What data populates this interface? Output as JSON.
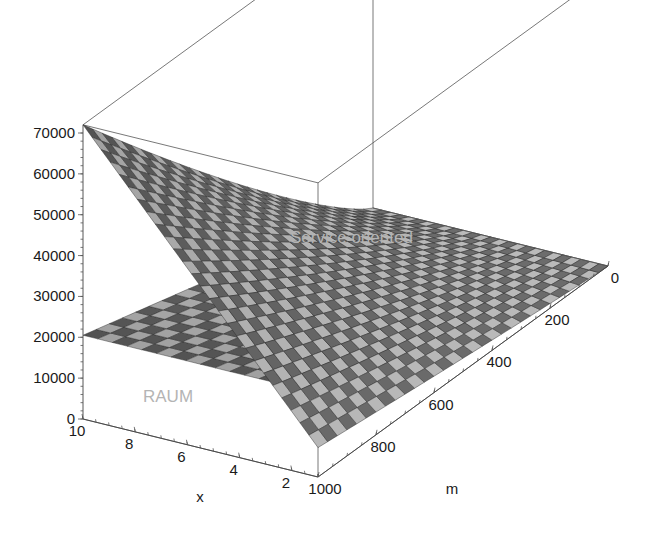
{
  "figure": {
    "kind": "3d-surface-mesh-plot",
    "background_color": "#ffffff",
    "line_color": "#555555",
    "label_color": "#b4b4b4",
    "tick_text_color": "#1a1a1a"
  },
  "axes": {
    "z": {
      "name": "z-axis",
      "title": "",
      "ticks": [
        0,
        10000,
        20000,
        30000,
        40000,
        50000,
        60000,
        70000
      ],
      "tick_labels": [
        "0",
        "10000",
        "20000",
        "30000",
        "40000",
        "50000",
        "60000",
        "70000"
      ],
      "range": [
        0,
        72000
      ]
    },
    "x": {
      "name": "x-axis",
      "title": "x",
      "ticks": [
        10,
        8,
        6,
        4,
        2
      ],
      "tick_labels": [
        "10",
        "8",
        "6",
        "4",
        "2"
      ],
      "range": [
        10,
        1
      ]
    },
    "m": {
      "name": "m-axis",
      "title": "m",
      "ticks": [
        1000,
        800,
        600,
        400,
        200,
        0
      ],
      "tick_labels": [
        "1000",
        "800",
        "600",
        "400",
        "200",
        "0"
      ],
      "range": [
        1000,
        0
      ]
    }
  },
  "annotations": [
    {
      "id": "service-oriented",
      "text": "Service oriented",
      "x": 290,
      "y": 243,
      "font_size": 17,
      "color": "#b4b4b4"
    },
    {
      "id": "raum",
      "text": "RAUM",
      "x": 143,
      "y": 402,
      "font_size": 17,
      "color": "#b4b4b4"
    }
  ],
  "chart_data": {
    "type": "surface",
    "title": "",
    "xlabel": "x",
    "ylabel": "m",
    "zlabel": "",
    "xlim": [
      1,
      10
    ],
    "ylim": [
      0,
      1000
    ],
    "zlim": [
      0,
      72000
    ],
    "grid": false,
    "legend": "inline-labels",
    "view": {
      "azimuth_deg": -50,
      "elevation_deg": 22,
      "projection": "parallel"
    },
    "surfaces": [
      {
        "name": "Service oriented",
        "mesh": "wireframe-shaded",
        "formula": "z = 7200 * x * (m/1000)^1.15",
        "description": "Steep curved surface rising toward x=10, m=1000; converges to zero at m=0.",
        "corner_values": [
          {
            "x": 10,
            "m": 1000,
            "z": 72000
          },
          {
            "x": 1,
            "m": 1000,
            "z": 7200
          },
          {
            "x": 10,
            "m": 0,
            "z": 0
          },
          {
            "x": 1,
            "m": 0,
            "z": 0
          }
        ],
        "z_samples": [
          {
            "x": 10,
            "m": 1000,
            "z": 72000
          },
          {
            "x": 10,
            "m": 800,
            "z": 56000
          },
          {
            "x": 10,
            "m": 600,
            "z": 40300
          },
          {
            "x": 10,
            "m": 400,
            "z": 25300
          },
          {
            "x": 10,
            "m": 200,
            "z": 11400
          },
          {
            "x": 6,
            "m": 1000,
            "z": 43200
          },
          {
            "x": 6,
            "m": 600,
            "z": 24200
          },
          {
            "x": 6,
            "m": 200,
            "z": 6800
          },
          {
            "x": 2,
            "m": 1000,
            "z": 14400
          },
          {
            "x": 2,
            "m": 600,
            "z": 8100
          },
          {
            "x": 2,
            "m": 200,
            "z": 2300
          }
        ]
      },
      {
        "name": "RAUM",
        "mesh": "wireframe-shaded",
        "formula": "z = 20500 * (m/1000)",
        "description": "Flat inclined plane independent of x; 20500 at m=1000 falling linearly to 0 at m=0.",
        "corner_values": [
          {
            "x": 10,
            "m": 1000,
            "z": 20500
          },
          {
            "x": 1,
            "m": 1000,
            "z": 20500
          },
          {
            "x": 10,
            "m": 0,
            "z": 0
          },
          {
            "x": 1,
            "m": 0,
            "z": 0
          }
        ],
        "z_samples": [
          {
            "x": 10,
            "m": 1000,
            "z": 20500
          },
          {
            "x": 10,
            "m": 800,
            "z": 16400
          },
          {
            "x": 10,
            "m": 600,
            "z": 12300
          },
          {
            "x": 10,
            "m": 400,
            "z": 8200
          },
          {
            "x": 10,
            "m": 200,
            "z": 4100
          },
          {
            "x": 2,
            "m": 1000,
            "z": 20500
          },
          {
            "x": 2,
            "m": 400,
            "z": 8200
          }
        ]
      }
    ],
    "intersection": {
      "description": "Surfaces cross where 7200*x*(m/1000)^1.15 = 20500*(m/1000); visible ridge running diagonally across the plot."
    }
  }
}
